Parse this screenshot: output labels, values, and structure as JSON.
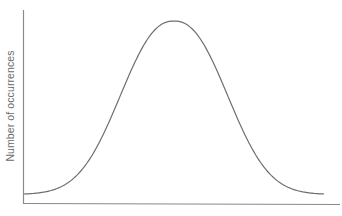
{
  "chart_data": {
    "type": "line",
    "title": "",
    "xlabel": "",
    "ylabel": "Number of occurrences",
    "grid": false,
    "legend": null,
    "series": [
      {
        "name": "distribution",
        "x": [
          0,
          10,
          20,
          30,
          40,
          45,
          50,
          55,
          60,
          70,
          80,
          90,
          100
        ],
        "values": [
          3,
          8,
          18,
          40,
          75,
          92,
          100,
          92,
          75,
          40,
          18,
          7,
          2
        ]
      }
    ],
    "xlim": [
      0,
      100
    ],
    "ylim": [
      0,
      100
    ],
    "colors": {
      "line": "#6e6e6e",
      "axes": "#8a8a8a",
      "background": "#ffffff"
    }
  },
  "axes": {
    "y_label": "Number of occurrences",
    "x_label": ""
  }
}
